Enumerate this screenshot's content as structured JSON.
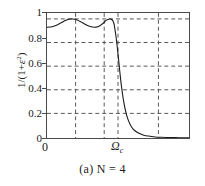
{
  "chart_data": {
    "type": "line",
    "title": "",
    "caption": "(a) N = 4",
    "xlabel": "",
    "ylabel": "1/(1+ε²)",
    "ylabel_parts": {
      "prefix": "1/(1+",
      "symbol": "ε",
      "exponent": "2",
      "suffix": ")"
    },
    "xlim": [
      0,
      2.1
    ],
    "ylim": [
      0,
      1.05
    ],
    "grid": true,
    "grid_style": "dashed",
    "grid_color": "#555555",
    "frame_color": "#4a4a4a",
    "line_color": "#1a1a1a",
    "legend": "none",
    "yticks": [
      0,
      0.2,
      0.4,
      0.6,
      0.8,
      1
    ],
    "ytick_labels": [
      "0",
      "0.2",
      "0.4",
      "0.6",
      "0.8",
      "1"
    ],
    "xticks": [
      0,
      0.42,
      0.84,
      1.0,
      1.6
    ],
    "xtick_labels": [
      "0",
      "",
      "",
      "Ωc",
      ""
    ],
    "xtick_origin_label": "0",
    "xtick_cutoff_label": "Ω",
    "xtick_cutoff_sub": "c",
    "hgridlines": [
      0.2,
      0.4,
      0.6,
      0.8,
      1.0
    ],
    "vgridlines": [
      0.42,
      0.84,
      1.0,
      1.6
    ],
    "ripple_min": 0.93,
    "ripple_max": 1.0,
    "order": 4,
    "series": [
      {
        "name": "Chebyshev magnitude response N=4",
        "x": [
          0.0,
          0.05,
          0.1,
          0.15,
          0.2,
          0.25,
          0.3,
          0.35,
          0.3827,
          0.42,
          0.46,
          0.5,
          0.55,
          0.6,
          0.65,
          0.7,
          0.75,
          0.8,
          0.84,
          0.88,
          0.9239,
          0.95,
          0.97,
          0.99,
          1.0,
          1.02,
          1.04,
          1.06,
          1.08,
          1.1,
          1.13,
          1.16,
          1.2,
          1.25,
          1.3,
          1.36,
          1.42,
          1.5,
          1.6,
          1.7,
          1.8,
          1.9,
          2.0,
          2.1
        ],
        "y": [
          0.93,
          0.932,
          0.938,
          0.95,
          0.965,
          0.981,
          0.994,
          1.0,
          1.0,
          0.997,
          0.988,
          0.976,
          0.96,
          0.945,
          0.934,
          0.93,
          0.934,
          0.95,
          0.968,
          0.99,
          1.0,
          0.998,
          0.988,
          0.962,
          0.93,
          0.855,
          0.76,
          0.65,
          0.54,
          0.44,
          0.32,
          0.232,
          0.152,
          0.093,
          0.061,
          0.039,
          0.026,
          0.016,
          0.009,
          0.006,
          0.004,
          0.003,
          0.002,
          0.0015
        ]
      }
    ]
  }
}
